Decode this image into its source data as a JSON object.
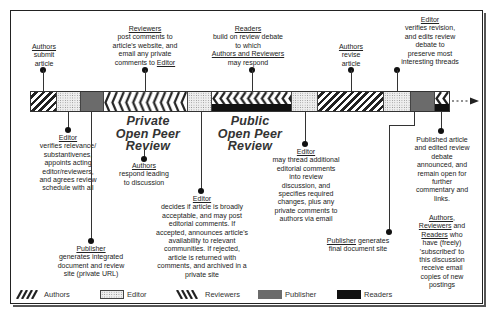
{
  "diagram": {
    "phases": {
      "private": "Private Open Peer Review",
      "private_lines": [
        "Private",
        "Open Peer",
        "Review"
      ],
      "public_lines": [
        "Public",
        "Open Peer",
        "Review"
      ]
    },
    "timeline_segments": [
      {
        "role": "Authors",
        "from": 30,
        "to": 56
      },
      {
        "role": "Editor",
        "from": 56,
        "to": 80
      },
      {
        "role": "Publisher",
        "from": 80,
        "to": 103
      },
      {
        "role": "Reviewers",
        "from": 103,
        "to": 187
      },
      {
        "role": "Editor",
        "from": 187,
        "to": 211
      },
      {
        "role": "Reviewers+Readers",
        "from": 211,
        "to": 291
      },
      {
        "role": "Editor",
        "from": 291,
        "to": 317
      },
      {
        "role": "Authors",
        "from": 317,
        "to": 383
      },
      {
        "role": "Editor",
        "from": 383,
        "to": 410
      },
      {
        "role": "Publisher",
        "from": 410,
        "to": 434
      },
      {
        "role": "Reviewers+Readers",
        "from": 434,
        "to": 449
      }
    ],
    "top_events": [
      {
        "actor": "Authors",
        "lines": [
          "submit",
          "article"
        ]
      },
      {
        "actor": "Reviewers",
        "lines": [
          "post comments to",
          "article's  website, and",
          "email any private",
          "comments to"
        ],
        "trailing_actor": "Editor"
      },
      {
        "actor": "Readers",
        "lines": [
          "build on review debate",
          "to which"
        ],
        "actor2": "Authors and Reviewers",
        "tail": "may respond"
      },
      {
        "actor": "Authors",
        "lines": [
          "revise",
          "article"
        ]
      },
      {
        "actor": "Editor",
        "lines": [
          "verifies revision,",
          "and edits review",
          "debate to",
          "preserve most",
          "interesting threads"
        ]
      }
    ],
    "bottom_events": [
      {
        "actor": "Editor",
        "lines": [
          "verifies relevance/",
          "substantivenes,",
          "appoints acting",
          "editor/reviewers,",
          "and agrees review",
          "schedule with all"
        ]
      },
      {
        "actor": "Publisher",
        "lines": [
          "generates integrated",
          "document and review",
          "site (private URL)"
        ]
      },
      {
        "actor": "Authors",
        "lines": [
          "respond leading",
          "to discussion"
        ]
      },
      {
        "actor": "Editor",
        "lines": [
          "decides if article is broadly",
          "acceptable, and may post",
          "editorial comments. If",
          "accepted, announces article's",
          "availability to relevant",
          "communities.  If rejected,",
          "article is returned with",
          "comments, and archived in a",
          "private site"
        ]
      },
      {
        "actor": "Editor",
        "lines": [
          "may thread additional",
          "editorial comments",
          "into review",
          "discussion, and",
          "specifies required",
          "changes, plus any",
          "private comments to",
          "authors via email"
        ]
      },
      {
        "actor": "Publisher",
        "rest": " generates",
        "lines": [
          "final document site"
        ]
      },
      {
        "lines": [
          "Published article",
          "and edited review",
          "debate",
          "announced, and",
          "remain open for",
          "further",
          "commentary and",
          "links."
        ]
      },
      {
        "actor1": "Authors",
        "actor2": "Reviewers",
        "actor3": "Readers",
        "sep1": ",",
        "and": " and",
        "who": " who",
        "lines": [
          "have  (freely)",
          "'subscribed' to",
          "this discussion",
          "receive email",
          "copies of new",
          "postings"
        ]
      }
    ]
  },
  "legend": [
    {
      "label": "Authors",
      "pattern": "diagonal-hatch"
    },
    {
      "label": "Editor",
      "pattern": "stipple"
    },
    {
      "label": "Reviewers",
      "pattern": "reverse-hatch"
    },
    {
      "label": "Publisher",
      "pattern": "solid",
      "color": "#6b6b6b"
    },
    {
      "label": "Readers",
      "pattern": "solid",
      "color": "#111111"
    }
  ]
}
